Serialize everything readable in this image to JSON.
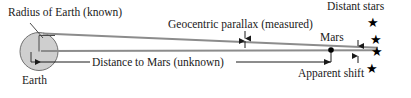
{
  "figure": {
    "background_color": "#ffffff",
    "line_color": "#8c8c8c",
    "dark_line_color": "#333333",
    "earth_fill": "#cfcfcf",
    "text_color": "#1a1a1a"
  },
  "labels": {
    "radius_of_earth": "Radius of Earth (known)",
    "geocentric_parallax": "Geocentric parallax (measured)",
    "distance_to_mars": "Distance to Mars (unknown)",
    "earth": "Earth",
    "mars": "Mars",
    "distant_stars": "Distant stars",
    "apparent_shift": "Apparent shift"
  },
  "objects": {
    "earth_circle": {
      "cx": 39,
      "cy": 51.5,
      "r": 19,
      "fill": "#cfcfcf"
    },
    "mars_dot": {
      "cx": 331,
      "cy": 50,
      "r": 2.6,
      "fill": "#000000"
    },
    "stars": [
      {
        "name": "star-1",
        "x": 367,
        "y": 16,
        "glyph": "★"
      },
      {
        "name": "star-2",
        "x": 370,
        "y": 33,
        "glyph": "★"
      },
      {
        "name": "star-3",
        "x": 371,
        "y": 45,
        "glyph": "★"
      },
      {
        "name": "star-4",
        "x": 366,
        "y": 62,
        "glyph": "★"
      }
    ]
  },
  "measures": {
    "parallax_arrow": {
      "x": 245,
      "y_top": 32,
      "y_bottom": 48
    },
    "apparent_shift_arrow": {
      "x": 358,
      "y_top": 41,
      "y_bottom": 63
    },
    "distance_arrow": {
      "x_start": 41,
      "x_end": 330,
      "y": 62
    }
  },
  "sight_lines": [
    {
      "name": "line-from-earth-top",
      "x1": 43,
      "y1": 33,
      "x2": 375,
      "y2": 48
    },
    {
      "name": "line-from-earth-center",
      "x1": 41,
      "y1": 51,
      "x2": 375,
      "y2": 50
    }
  ],
  "icons": {
    "star": "star-icon",
    "planet-dot": "mars-dot-icon"
  }
}
